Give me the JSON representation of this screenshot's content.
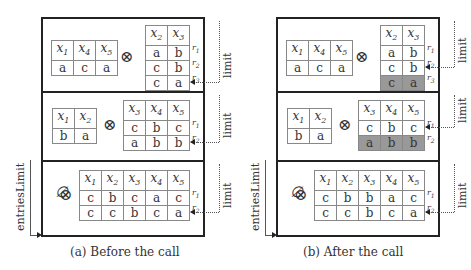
{
  "panels": [
    {
      "caption": "(a) Before the call",
      "entries_limit_label": "entriesLimit",
      "rows": [
        {
          "left": {
            "headers": [
              "x1",
              "x4",
              "x5"
            ],
            "rows": [
              [
                "a",
                "c",
                "a"
              ]
            ]
          },
          "operator": "⊗",
          "right": {
            "headers": [
              "x2",
              "x3"
            ],
            "rows": [
              [
                "a",
                "b"
              ],
              [
                "c",
                "b"
              ],
              [
                "c",
                "a"
              ]
            ],
            "shaded_rows": [],
            "row_labels": [
              "r1",
              "r2",
              "r3"
            ]
          },
          "limit_label": "limit",
          "limit_points_to_row": 3
        },
        {
          "left": {
            "headers": [
              "x1",
              "x2"
            ],
            "rows": [
              [
                "b",
                "a"
              ]
            ]
          },
          "operator": "⊗",
          "right": {
            "headers": [
              "x3",
              "x4",
              "x5"
            ],
            "rows": [
              [
                "c",
                "b",
                "c"
              ],
              [
                "a",
                "b",
                "b"
              ]
            ],
            "shaded_rows": [],
            "row_labels": [
              "r1",
              "r2"
            ]
          },
          "limit_label": "limit",
          "limit_points_to_row": 2
        },
        {
          "left_symbol": "∅",
          "operator": "⊗",
          "right": {
            "headers": [
              "x1",
              "x2",
              "x3",
              "x4",
              "x5"
            ],
            "rows": [
              [
                "c",
                "b",
                "c",
                "a",
                "c"
              ],
              [
                "c",
                "c",
                "b",
                "c",
                "a"
              ]
            ],
            "shaded_rows": [],
            "row_labels": [
              "r1",
              "r2"
            ]
          },
          "limit_label": "limit",
          "limit_points_to_row": 2
        }
      ]
    },
    {
      "caption": "(b) After the call",
      "entries_limit_label": "entriesLimit",
      "rows": [
        {
          "left": {
            "headers": [
              "x1",
              "x4",
              "x5"
            ],
            "rows": [
              [
                "a",
                "c",
                "a"
              ]
            ]
          },
          "operator": "⊗",
          "right": {
            "headers": [
              "x2",
              "x3"
            ],
            "rows": [
              [
                "a",
                "b"
              ],
              [
                "c",
                "b"
              ],
              [
                "c",
                "a"
              ]
            ],
            "shaded_rows": [
              3
            ],
            "row_labels": [
              "r1",
              "r2",
              "r3"
            ]
          },
          "limit_label": "limit",
          "limit_points_to_row": 2
        },
        {
          "left": {
            "headers": [
              "x1",
              "x2"
            ],
            "rows": [
              [
                "b",
                "a"
              ]
            ]
          },
          "operator": "⊗",
          "right": {
            "headers": [
              "x3",
              "x4",
              "x5"
            ],
            "rows": [
              [
                "c",
                "b",
                "c"
              ],
              [
                "a",
                "b",
                "b"
              ]
            ],
            "shaded_rows": [
              2
            ],
            "row_labels": [
              "r1",
              "r2"
            ]
          },
          "limit_label": "limit",
          "limit_points_to_row": 1
        },
        {
          "left_symbol": "∅",
          "operator": "⊗",
          "right": {
            "headers": [
              "x1",
              "x2",
              "x3",
              "x4",
              "x5"
            ],
            "rows": [
              [
                "c",
                "b",
                "b",
                "a",
                "c"
              ],
              [
                "c",
                "c",
                "b",
                "c",
                "a"
              ]
            ],
            "shaded_rows": [],
            "row_labels": [
              "r1",
              "r2"
            ]
          },
          "limit_label": "limit",
          "limit_points_to_row": 2
        }
      ]
    }
  ],
  "colors": {
    "frame": "#222222",
    "cell_border": "#888888",
    "shaded": "#999999"
  }
}
